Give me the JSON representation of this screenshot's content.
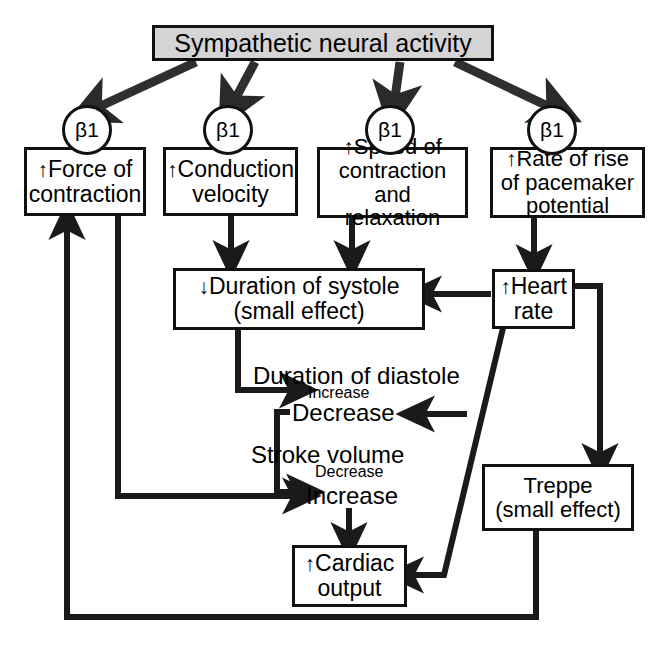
{
  "diagram": {
    "colors": {
      "line": "#111111",
      "header_fill": "#d4d4d4",
      "node_fill": "#ffffff",
      "text": "#000000"
    },
    "header": {
      "label": "Sympathetic neural activity"
    },
    "receptors": [
      {
        "label": "β1",
        "symbol": "β",
        "subscript": "1"
      },
      {
        "label": "β1",
        "symbol": "β",
        "subscript": "1"
      },
      {
        "label": "β1",
        "symbol": "β",
        "subscript": "1"
      },
      {
        "label": "β1",
        "symbol": "β",
        "subscript": "1"
      }
    ],
    "nodes": [
      {
        "id": "force",
        "arrow": "↑",
        "line1": "Force of",
        "line2": "contraction",
        "line3": ""
      },
      {
        "id": "conduction",
        "arrow": "↑",
        "line1": "Conduction",
        "line2": "velocity",
        "line3": ""
      },
      {
        "id": "speed",
        "arrow": "↑",
        "line1": "Speed of",
        "line2": "contraction and",
        "line3": "relaxation"
      },
      {
        "id": "pacemaker",
        "arrow": "↑",
        "line1": "Rate of rise",
        "line2": "of pacemaker",
        "line3": "potential"
      },
      {
        "id": "systole",
        "arrow": "↓",
        "line1": "Duration of systole",
        "line2": "(small effect)",
        "line3": ""
      },
      {
        "id": "heartrate",
        "arrow": "↑",
        "line1": "Heart",
        "line2": "rate",
        "line3": ""
      },
      {
        "id": "treppe",
        "arrow": "",
        "line1": "Treppe",
        "line2": "(small effect)",
        "line3": ""
      },
      {
        "id": "cardiac",
        "arrow": "↑",
        "line1": "Cardiac",
        "line2": "output",
        "line3": ""
      }
    ],
    "labels": {
      "diastole_title": "Duration of diastole",
      "diastole_increase": "Increase",
      "diastole_decrease": "Decrease",
      "stroke_title": "Stroke volume",
      "stroke_decrease": "Decrease",
      "stroke_increase": "Increase"
    }
  }
}
